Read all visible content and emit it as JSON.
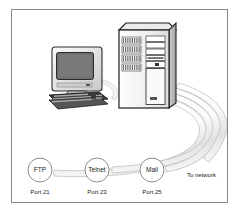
{
  "figure": {
    "frame": {
      "border_color": "#8a8a8a",
      "background": "#ffffff"
    }
  },
  "devices": [
    {
      "id": "workstation",
      "name": "desktop-computer",
      "label": ""
    },
    {
      "id": "server",
      "name": "tower-server",
      "label": ""
    }
  ],
  "ports": [
    {
      "service": "FTP",
      "caption": "Port 21"
    },
    {
      "service": "Telnet",
      "caption": "Port 23"
    },
    {
      "service": "Mail",
      "caption": "Port 25"
    }
  ],
  "network": {
    "label": "To network"
  },
  "colors": {
    "line": "#6e6e6e",
    "cable_fill": "#f2f2f2",
    "cable_stroke": "#bdbdbd",
    "screen": "#6b6b6b",
    "case_light": "#f7f7f7",
    "case_mid": "#d8d8d8",
    "case_dark": "#3a3a3a",
    "text": "#1a1a1a"
  }
}
